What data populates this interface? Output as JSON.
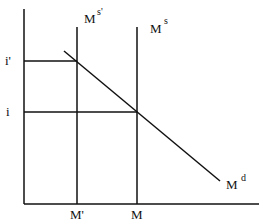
{
  "diagram": {
    "title_cutoff": "Rate",
    "axes": {
      "y_label": "",
      "x_label": ""
    },
    "y_ticks": [
      {
        "label": "i'",
        "y": 61
      },
      {
        "label": "i",
        "y": 112
      }
    ],
    "x_ticks": [
      {
        "label": "M'",
        "x": 77
      },
      {
        "label": "M",
        "x": 137
      }
    ],
    "curves": [
      {
        "name": "money-supply-new",
        "label_main": "M",
        "label_sup": "s'"
      },
      {
        "name": "money-supply",
        "label_main": "M",
        "label_sup": "s"
      },
      {
        "name": "money-demand",
        "label_main": "M",
        "label_sup": "d"
      }
    ],
    "colors": {
      "line": "#111111",
      "background": "#ffffff"
    }
  }
}
